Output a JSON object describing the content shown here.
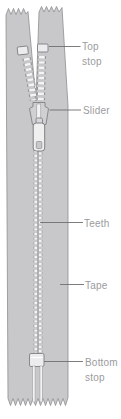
{
  "figure": {
    "background_color": "#ffffff",
    "colors": {
      "tape_fill": "#c8c8ca",
      "tape_outline": "#8e8e91",
      "teeth_fill": "#f4f4f5",
      "teeth_outline": "#96969a",
      "stop_fill": "#ececee",
      "stop_outline": "#7f7f84",
      "slider_fill": "#d0d0d3",
      "slider_outline": "#808085",
      "label_text": "#9b9b9e",
      "leader_line": "#6e6e71",
      "background": "#ffffff"
    },
    "labels": [
      {
        "id": "top-stop",
        "line1": "Top",
        "line2": "stop"
      },
      {
        "id": "slider",
        "line1": "Slider",
        "line2": ""
      },
      {
        "id": "teeth",
        "line1": "Teeth",
        "line2": ""
      },
      {
        "id": "tape",
        "line1": "Tape",
        "line2": ""
      },
      {
        "id": "bottom-stop",
        "line1": "Bottom",
        "line2": "stop"
      }
    ],
    "parts": [
      "Top stop",
      "Slider",
      "Teeth",
      "Tape",
      "Bottom stop"
    ]
  }
}
